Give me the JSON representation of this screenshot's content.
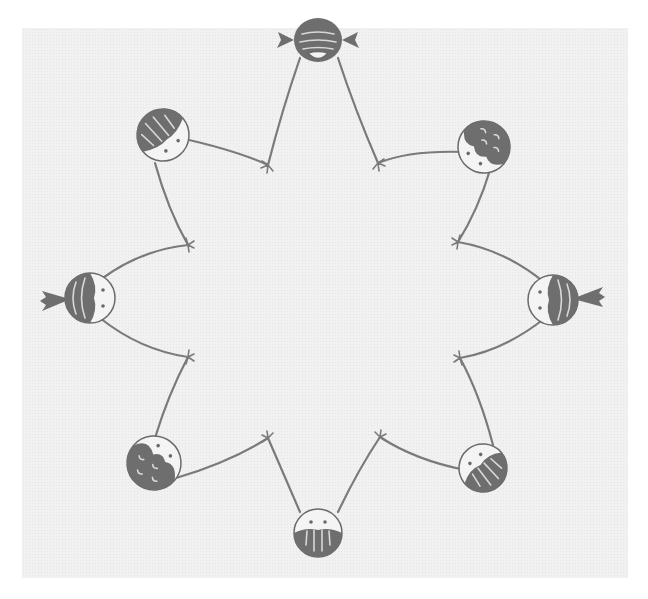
{
  "illustration": {
    "subject": "Eight children seen from above holding hands in a circle",
    "colors": {
      "background": "#ffffff",
      "paper": "#f1f1f1",
      "ink": "#6e6e6e"
    },
    "children": [
      {
        "id": "top",
        "hairstyle": "pigtails",
        "facing": "center"
      },
      {
        "id": "top-right",
        "hairstyle": "curly",
        "facing": "center"
      },
      {
        "id": "right",
        "hairstyle": "ponytail",
        "facing": "center"
      },
      {
        "id": "bottom-right",
        "hairstyle": "straight",
        "facing": "center"
      },
      {
        "id": "bottom",
        "hairstyle": "straight",
        "facing": "center"
      },
      {
        "id": "bottom-left",
        "hairstyle": "curly",
        "facing": "center"
      },
      {
        "id": "left",
        "hairstyle": "ponytail",
        "facing": "center"
      },
      {
        "id": "top-left",
        "hairstyle": "straight",
        "facing": "center"
      }
    ]
  }
}
